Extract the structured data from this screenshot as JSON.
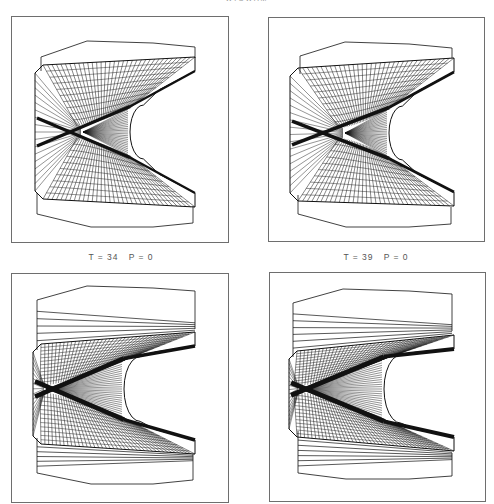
{
  "figure": {
    "header": "WIGWAM",
    "colors": {
      "ink": "#111111",
      "frame": "#6e6e6e",
      "background": "#ffffff"
    },
    "captions": [
      {
        "text": "T = 34   P = 0",
        "x": 121,
        "y": 252
      },
      {
        "text": "T = 39   P = 0",
        "x": 376,
        "y": 252
      }
    ],
    "panels": [
      {
        "id": "panel-1",
        "x": 11,
        "y": 16,
        "w": 218,
        "h": 227,
        "outline_top": [
          [
            29,
            40
          ],
          [
            75,
            24
          ],
          [
            141,
            26
          ],
          [
            183,
            30
          ],
          [
            183,
            41
          ]
        ],
        "outline_bottom": [
          [
            25,
            197
          ],
          [
            79,
            210
          ],
          [
            141,
            210
          ],
          [
            181,
            206
          ],
          [
            181,
            189
          ]
        ],
        "mesh": {
          "left": 23,
          "top": 48,
          "right": 183,
          "bottom": 182,
          "cx": 75,
          "cy": 115,
          "throat_x": 118,
          "throat_w": 30,
          "arm_top": 40,
          "arm_bottom": 190,
          "fans": 34,
          "rings": 9,
          "compress": 0.0
        },
        "stripes": 0
      },
      {
        "id": "panel-2",
        "x": 268,
        "y": 17,
        "w": 217,
        "h": 225,
        "outline_top": [
          [
            31,
            38
          ],
          [
            76,
            24
          ],
          [
            140,
            26
          ],
          [
            183,
            30
          ],
          [
            183,
            40
          ]
        ],
        "outline_bottom": [
          [
            29,
            196
          ],
          [
            77,
            209
          ],
          [
            140,
            209
          ],
          [
            182,
            206
          ],
          [
            182,
            189
          ]
        ],
        "mesh": {
          "left": 21,
          "top": 50,
          "right": 185,
          "bottom": 183,
          "cx": 80,
          "cy": 115,
          "throat_x": 120,
          "throat_w": 30,
          "arm_top": 40,
          "arm_bottom": 188,
          "fans": 34,
          "rings": 9,
          "compress": 0.15
        },
        "stripes": 0
      },
      {
        "id": "panel-3",
        "x": 11,
        "y": 273,
        "w": 218,
        "h": 230,
        "outline_top": [
          [
            25,
            26
          ],
          [
            75,
            12
          ],
          [
            141,
            14
          ],
          [
            183,
            17
          ],
          [
            183,
            55
          ]
        ],
        "outline_bottom": [
          [
            25,
            199
          ],
          [
            79,
            210
          ],
          [
            141,
            210
          ],
          [
            181,
            206
          ],
          [
            181,
            180
          ]
        ],
        "mesh": {
          "left": 21,
          "top": 70,
          "right": 183,
          "bottom": 170,
          "cx": 38,
          "cy": 115,
          "throat_x": 112,
          "throat_w": 36,
          "arm_top": 58,
          "arm_bottom": 180,
          "fans": 40,
          "rings": 11,
          "compress": 0.45
        },
        "stripes": 5
      },
      {
        "id": "panel-4",
        "x": 269,
        "y": 272,
        "w": 217,
        "h": 230,
        "outline_top": [
          [
            23,
            30
          ],
          [
            73,
            16
          ],
          [
            139,
            18
          ],
          [
            182,
            21
          ],
          [
            182,
            58
          ]
        ],
        "outline_bottom": [
          [
            28,
            200
          ],
          [
            76,
            206
          ],
          [
            139,
            206
          ],
          [
            182,
            203
          ],
          [
            182,
            180
          ]
        ],
        "mesh": {
          "left": 19,
          "top": 78,
          "right": 184,
          "bottom": 164,
          "cx": 34,
          "cy": 116,
          "throat_x": 114,
          "throat_w": 38,
          "arm_top": 62,
          "arm_bottom": 178,
          "fans": 42,
          "rings": 12,
          "compress": 0.55
        },
        "stripes": 6
      }
    ]
  }
}
